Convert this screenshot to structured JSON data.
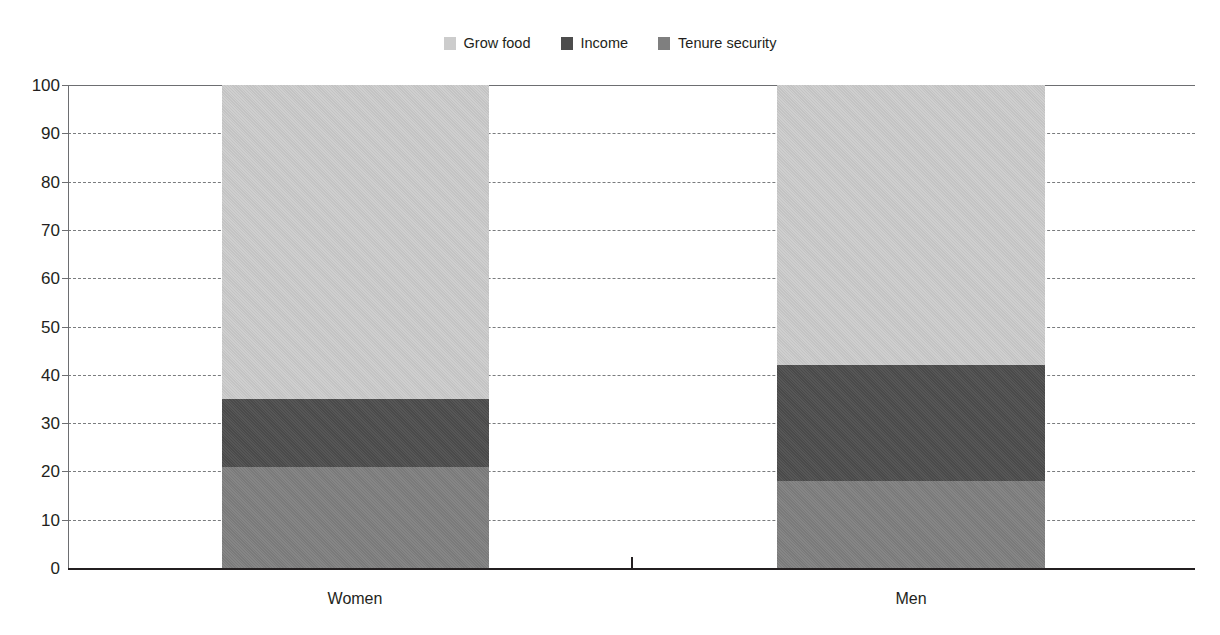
{
  "chart_data": {
    "type": "bar",
    "subtype": "stacked-bar-100",
    "title": "",
    "subtitle": "",
    "xlabel": "",
    "ylabel": "",
    "categories": [
      "Women",
      "Men"
    ],
    "ylim": [
      0,
      100
    ],
    "yticks": [
      0,
      10,
      20,
      30,
      40,
      50,
      60,
      70,
      80,
      90,
      100
    ],
    "ytick_labels": [
      "0",
      "10",
      "20",
      "30",
      "40",
      "50",
      "60",
      "70",
      "80",
      "90",
      "100"
    ],
    "grid": true,
    "grid_style": "dashed-horizontal",
    "legend_position": "top-center",
    "stack_order_bottom_to_top": [
      "Tenure security",
      "Income",
      "Grow food"
    ],
    "series": [
      {
        "name": "Grow food",
        "color": "#cccccc",
        "values": [
          65,
          58
        ]
      },
      {
        "name": "Income",
        "color": "#4d4d4d",
        "values": [
          14,
          24
        ]
      },
      {
        "name": "Tenure security",
        "color": "#7f7f7f",
        "values": [
          21,
          18
        ]
      }
    ],
    "cumulative_tops": {
      "Women": {
        "Tenure security": 21,
        "Income": 35,
        "Grow food": 100
      },
      "Men": {
        "Tenure security": 18,
        "Income": 42,
        "Grow food": 100
      }
    }
  },
  "legend": {
    "items": [
      {
        "label": "Grow food",
        "color": "#cccccc",
        "swatch_name": "legend-swatch-grow-food"
      },
      {
        "label": "Income",
        "color": "#4d4d4d",
        "swatch_name": "legend-swatch-income"
      },
      {
        "label": "Tenure security",
        "color": "#7f7f7f",
        "swatch_name": "legend-swatch-tenure-security"
      }
    ]
  },
  "axes": {
    "y": {
      "labels": [
        "100",
        "90",
        "80",
        "70",
        "60",
        "50",
        "40",
        "30",
        "20",
        "10",
        "0"
      ]
    },
    "x": {
      "labels": [
        "Women",
        "Men"
      ]
    }
  },
  "colors": {
    "grow_food": "#cccccc",
    "income": "#4d4d4d",
    "tenure_security": "#7f7f7f",
    "gridline": "#7a7c7e",
    "axis": "#231f20",
    "text": "#231f20",
    "background": "#ffffff"
  }
}
